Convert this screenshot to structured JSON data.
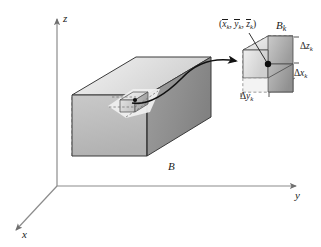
{
  "figure": {
    "kind": "math-diagram-3d-box-partition",
    "background_color": "#ffffff",
    "stroke_color": "#1b1b1b",
    "axis_color": "#8c8c8c",
    "dash_color": "#6e6e6e",
    "face_light": "#e8e8e8",
    "face_mid": "#bdbdbd",
    "face_dark": "#8f8f8f",
    "width": 321,
    "height": 247
  },
  "axes": {
    "z_label": "z",
    "y_label": "y",
    "x_label": "x"
  },
  "main_box": {
    "label": "B",
    "description": "large shaded rectangular box sitting on the xy-plane"
  },
  "sub_box_inset": {
    "label": "B",
    "label_subscript": "k",
    "description": "small highlighted sub-box inside B"
  },
  "callout": {
    "label": "B",
    "label_subscript": "k",
    "point_open": "(",
    "point_x": "x",
    "point_x_sub": "k",
    "comma_1": ", ",
    "point_y": "y",
    "point_y_sub": "k",
    "comma_2": ", ",
    "point_z": "z",
    "point_z_sub": "k",
    "point_close": ")",
    "delta_z": "Δ",
    "delta_z_var": "z",
    "delta_z_sub": "k",
    "delta_x": "Δ",
    "delta_x_var": "x",
    "delta_x_sub": "k",
    "delta_y": "Δ",
    "delta_y_var": "y",
    "delta_y_sub": "k"
  }
}
